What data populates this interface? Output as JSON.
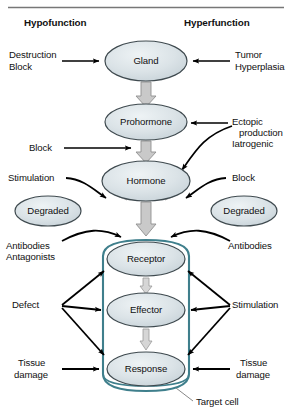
{
  "figure": {
    "title_rule": true,
    "headers": {
      "left": "Hypofunction",
      "right": "Hyperfunction"
    },
    "colors": {
      "node_fill": "#d3dce0",
      "node_fill_light": "#e2e9ec",
      "node_stroke": "#3f4a4f",
      "cell_stroke": "#3f7f8c",
      "arrow_black": "#000000",
      "block_arrow_fill": "#c9c9c9",
      "block_arrow_stroke": "#8a8a8a",
      "rule": "#777777",
      "text": "#111111"
    },
    "nodes": [
      {
        "id": "gland",
        "label": "Gland",
        "cx": 146,
        "cy": 61,
        "rx": 41,
        "ry": 20
      },
      {
        "id": "prohormone",
        "label": "Prohormone",
        "cx": 146,
        "cy": 122,
        "rx": 41,
        "ry": 18
      },
      {
        "id": "hormone",
        "label": "Hormone",
        "cx": 146,
        "cy": 181,
        "rx": 44,
        "ry": 20
      },
      {
        "id": "degraded_l",
        "label": "Degraded",
        "cx": 48,
        "cy": 211,
        "rx": 33,
        "ry": 15
      },
      {
        "id": "degraded_r",
        "label": "Degraded",
        "cx": 244,
        "cy": 211,
        "rx": 33,
        "ry": 15
      },
      {
        "id": "receptor",
        "label": "Receptor",
        "cx": 146,
        "cy": 259,
        "rx": 39,
        "ry": 17
      },
      {
        "id": "effector",
        "label": "Effector",
        "cx": 146,
        "cy": 310,
        "rx": 39,
        "ry": 17
      },
      {
        "id": "response",
        "label": "Response",
        "cx": 146,
        "cy": 369,
        "rx": 39,
        "ry": 17
      }
    ],
    "cell": {
      "label": "Target cell",
      "x": 103,
      "y": 240,
      "width": 86,
      "height": 150
    },
    "annotations": [
      {
        "id": "destruction-block",
        "lines": [
          "Destruction",
          "Block"
        ],
        "side": "left"
      },
      {
        "id": "tumor-hyperplasia",
        "lines": [
          "Tumor",
          "Hyperplasia"
        ],
        "side": "right"
      },
      {
        "id": "block-prohormone",
        "lines": [
          "Block"
        ],
        "side": "left"
      },
      {
        "id": "ectopic-iatrogenic",
        "lines": [
          "Ectopic",
          "production",
          "Iatrogenic"
        ],
        "side": "right"
      },
      {
        "id": "stimulation-hormone",
        "lines": [
          "Stimulation"
        ],
        "side": "left"
      },
      {
        "id": "block-hormone",
        "lines": [
          "Block"
        ],
        "side": "right"
      },
      {
        "id": "antibodies-antagonists",
        "lines": [
          "Antibodies",
          "Antagonists"
        ],
        "side": "left"
      },
      {
        "id": "antibodies",
        "lines": [
          "Antibodies"
        ],
        "side": "right"
      },
      {
        "id": "defect",
        "lines": [
          "Defect"
        ],
        "side": "left"
      },
      {
        "id": "stimulation-cell",
        "lines": [
          "Stimulation"
        ],
        "side": "right"
      },
      {
        "id": "tissue-damage-left",
        "lines": [
          "Tissue",
          "damage"
        ],
        "side": "left"
      },
      {
        "id": "tissue-damage-right",
        "lines": [
          "Tissue",
          "damage"
        ],
        "side": "right"
      }
    ]
  }
}
